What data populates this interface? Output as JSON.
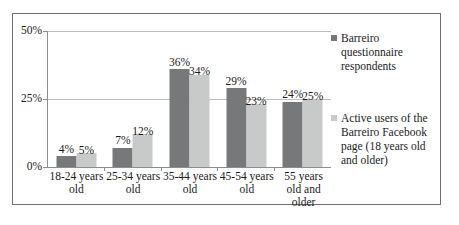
{
  "chart_data": {
    "type": "bar",
    "title": "",
    "subtitle": "",
    "xlabel": "",
    "ylabel": "",
    "ylim": [
      0,
      50
    ],
    "yticks": [
      "0%",
      "25%",
      "50%"
    ],
    "ytick_values": [
      0,
      25,
      50
    ],
    "grid": true,
    "legend_position": "right",
    "categories": [
      "18-24 years old",
      "25-34 years old",
      "35-44 years old",
      "45-54 years old",
      "55 years old and older"
    ],
    "series": [
      {
        "name": "Barreiro questionnaire respondents",
        "color": "#77787a",
        "values": [
          4,
          7,
          36,
          29,
          24
        ],
        "labels": [
          "4%",
          "7%",
          "36%",
          "29%",
          "24%"
        ]
      },
      {
        "name": "Active users of the Barreiro Facebook page (18 years old and older)",
        "color": "#c8c9c9",
        "values": [
          5,
          12,
          34,
          23,
          25
        ],
        "labels": [
          "5%",
          "12%",
          "34%",
          "23%",
          "25%"
        ]
      }
    ]
  },
  "legend": {
    "items": [
      {
        "label": "Barreiro questionnaire respondents",
        "color": "#77787a"
      },
      {
        "label": "Active users of the Barreiro Facebook page (18 years old and older)",
        "color": "#c8c9c9"
      }
    ]
  }
}
